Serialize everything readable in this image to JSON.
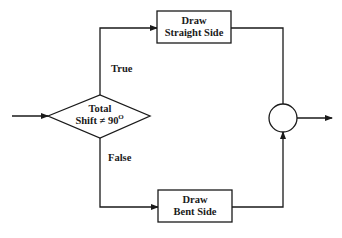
{
  "diagram": {
    "type": "flowchart",
    "nodes": {
      "decision": {
        "line1": "Total",
        "line2": "Shift ≠ 90",
        "superscript": "O"
      },
      "straight": {
        "line1": "Draw",
        "line2": "Straight Side"
      },
      "bent": {
        "line1": "Draw",
        "line2": "Bent Side"
      },
      "junction": {
        "shape": "circle"
      }
    },
    "edges": {
      "true_label": "True",
      "false_label": "False"
    },
    "colors": {
      "stroke": "#1a1a1a",
      "background": "#ffffff"
    }
  }
}
